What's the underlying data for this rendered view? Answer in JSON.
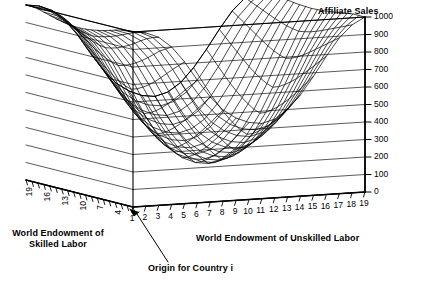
{
  "chart_data": {
    "type": "surface",
    "title": "Affiliate Sales",
    "xlabel": "World Endowment of Unskilled Labor",
    "ylabel": "World Endowment of Skilled Labor",
    "zlabel": "Affiliate Sales",
    "grid": true,
    "legend": "none",
    "projection": "3d-wireframe",
    "style": "monochrome black mesh on white, back and left wall gridlines",
    "zlim": [
      0,
      1000
    ],
    "z_ticks": [
      0,
      100,
      200,
      300,
      400,
      500,
      600,
      700,
      800,
      900,
      1000
    ],
    "z_tick_labels": [
      "0",
      "100",
      "200",
      "300",
      "400",
      "500",
      "600",
      "700",
      "800",
      "900",
      "1000"
    ],
    "xlim": [
      1,
      19
    ],
    "x_ticks": [
      1,
      2,
      3,
      4,
      5,
      6,
      7,
      8,
      9,
      10,
      11,
      12,
      13,
      14,
      15,
      16,
      17,
      18,
      19
    ],
    "x_tick_labels": [
      "1",
      "2",
      "3",
      "4",
      "5",
      "6",
      "7",
      "8",
      "9",
      "10",
      "11",
      "12",
      "13",
      "14",
      "15",
      "16",
      "17",
      "18",
      "19"
    ],
    "ylim": [
      1,
      19
    ],
    "y_ticks": [
      4,
      7,
      10,
      13,
      16,
      19
    ],
    "y_tick_labels": [
      "19",
      "16",
      "13",
      "10",
      "7",
      "4"
    ],
    "y_minor_tick_count": 19,
    "annotations": [
      {
        "text": "Origin for Country i",
        "points_to": "origin",
        "has_leader_line": true
      }
    ],
    "surface_description": "Saddle / valley shaped surface: elevated plateau near 1000 at back-left ridge, deep trough dropping toward 300-400 across the front-center, and a steep rise back up to about 1000 along the right-hand edge.",
    "z_values_by_row": [
      [
        1000,
        990,
        960,
        900,
        810,
        700,
        600,
        520,
        470,
        440,
        430,
        450,
        500,
        580,
        680,
        790,
        890,
        960,
        1000
      ],
      [
        1000,
        985,
        950,
        880,
        780,
        665,
        560,
        480,
        425,
        395,
        385,
        405,
        455,
        535,
        640,
        755,
        865,
        945,
        1000
      ],
      [
        995,
        975,
        935,
        860,
        750,
        630,
        520,
        435,
        380,
        348,
        338,
        358,
        408,
        490,
        598,
        720,
        840,
        930,
        1000
      ],
      [
        985,
        960,
        915,
        832,
        718,
        592,
        480,
        395,
        338,
        305,
        295,
        315,
        365,
        448,
        558,
        686,
        815,
        915,
        995
      ],
      [
        975,
        945,
        892,
        805,
        685,
        556,
        442,
        356,
        298,
        265,
        255,
        275,
        325,
        408,
        520,
        652,
        790,
        900,
        990
      ],
      [
        965,
        930,
        872,
        780,
        655,
        522,
        406,
        320,
        262,
        230,
        220,
        240,
        290,
        372,
        486,
        620,
        765,
        885,
        985
      ],
      [
        958,
        918,
        855,
        758,
        628,
        492,
        375,
        288,
        230,
        198,
        188,
        208,
        258,
        340,
        455,
        592,
        742,
        872,
        980
      ],
      [
        952,
        908,
        840,
        740,
        606,
        466,
        348,
        260,
        202,
        170,
        160,
        180,
        230,
        312,
        428,
        568,
        722,
        860,
        976
      ],
      [
        948,
        900,
        830,
        726,
        588,
        446,
        326,
        238,
        180,
        148,
        138,
        158,
        208,
        290,
        406,
        548,
        706,
        852,
        974
      ],
      [
        946,
        896,
        824,
        717,
        577,
        433,
        312,
        224,
        166,
        134,
        124,
        144,
        194,
        276,
        392,
        536,
        696,
        846,
        972
      ],
      [
        948,
        900,
        830,
        726,
        588,
        446,
        326,
        238,
        180,
        148,
        138,
        158,
        208,
        290,
        406,
        548,
        706,
        852,
        974
      ],
      [
        952,
        908,
        840,
        740,
        606,
        466,
        348,
        260,
        202,
        170,
        160,
        180,
        230,
        312,
        428,
        568,
        722,
        860,
        976
      ],
      [
        958,
        918,
        855,
        758,
        628,
        492,
        375,
        288,
        230,
        198,
        188,
        208,
        258,
        340,
        455,
        592,
        742,
        872,
        980
      ],
      [
        965,
        930,
        872,
        780,
        655,
        522,
        406,
        320,
        262,
        230,
        220,
        240,
        290,
        372,
        486,
        620,
        765,
        885,
        985
      ],
      [
        975,
        945,
        892,
        805,
        685,
        556,
        442,
        356,
        298,
        265,
        255,
        275,
        325,
        408,
        520,
        652,
        790,
        900,
        990
      ],
      [
        985,
        960,
        915,
        832,
        718,
        592,
        480,
        395,
        338,
        305,
        295,
        315,
        365,
        448,
        558,
        686,
        815,
        915,
        995
      ],
      [
        995,
        975,
        935,
        860,
        750,
        630,
        520,
        435,
        380,
        348,
        338,
        358,
        408,
        490,
        598,
        720,
        840,
        930,
        1000
      ],
      [
        1000,
        985,
        950,
        880,
        780,
        665,
        560,
        480,
        425,
        395,
        385,
        405,
        455,
        535,
        640,
        755,
        865,
        945,
        1000
      ],
      [
        1000,
        990,
        960,
        900,
        810,
        700,
        600,
        520,
        470,
        440,
        430,
        450,
        500,
        580,
        680,
        790,
        890,
        960,
        1000
      ]
    ]
  },
  "figure": {
    "title": "Affiliate Sales",
    "xaxis_title": "World Endowment of Unskilled Labor",
    "yaxis_title": "World Endowment of Skilled Labor",
    "origin_annotation": "Origin for Country i",
    "colors": {
      "ink": "#000000",
      "background": "#ffffff",
      "grid": "#1a1a1a"
    }
  }
}
